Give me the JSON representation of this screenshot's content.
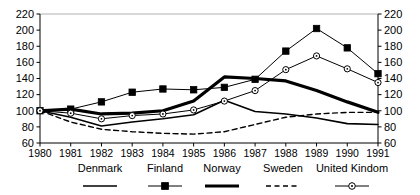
{
  "chart_data": {
    "type": "line",
    "title": "",
    "subtitle": "",
    "xlabel": "",
    "ylabel": "",
    "x": [
      1980,
      1981,
      1982,
      1983,
      1984,
      1985,
      1986,
      1987,
      1988,
      1989,
      1990,
      1991
    ],
    "categories": [
      "1980",
      "1981",
      "1982",
      "1983",
      "1984",
      "1985",
      "1986",
      "1987",
      "1988",
      "1989",
      "1990",
      "1991"
    ],
    "xlim": [
      1980,
      1991
    ],
    "ylim": [
      60,
      220
    ],
    "yticks": [
      60,
      80,
      100,
      120,
      140,
      160,
      180,
      200,
      220
    ],
    "ytick_labels": [
      "60",
      "80",
      "100",
      "120",
      "140",
      "160",
      "180",
      "200",
      "220"
    ],
    "y_axis_right": true,
    "y_axis_right_ticks": [
      60,
      80,
      100,
      120,
      140,
      160,
      180,
      200,
      220
    ],
    "y_axis_right_labels": [
      "60",
      "80",
      "100",
      "120",
      "140",
      "160",
      "180",
      "200",
      "220"
    ],
    "grid": false,
    "legend_position": "bottom",
    "series": [
      {
        "name": "Denmark",
        "values": [
          100,
          92,
          81,
          86,
          90,
          95,
          113,
          99,
          96,
          91,
          84,
          83
        ],
        "style": "thin-solid",
        "marker": "none",
        "color": "#000000",
        "width": 1.6
      },
      {
        "name": "Finland",
        "values": [
          100,
          102,
          111,
          123,
          127,
          126,
          129,
          139,
          174,
          202,
          178,
          146
        ],
        "style": "thin-solid",
        "marker": "filled-square",
        "color": "#000000",
        "width": 1.0
      },
      {
        "name": "Norway",
        "values": [
          100,
          102,
          96,
          97,
          100,
          112,
          142,
          140,
          137,
          125,
          111,
          98
        ],
        "style": "thick-solid",
        "marker": "none",
        "color": "#000000",
        "width": 3.2
      },
      {
        "name": "Sweden",
        "values": [
          100,
          86,
          77,
          74,
          72,
          71,
          74,
          83,
          92,
          96,
          98,
          98
        ],
        "style": "dashed",
        "marker": "none",
        "color": "#000000",
        "width": 1.4
      },
      {
        "name": "United Kindom",
        "values": [
          100,
          97,
          90,
          94,
          96,
          101,
          112,
          125,
          151,
          168,
          152,
          135
        ],
        "style": "thin-solid",
        "marker": "open-circle",
        "color": "#000000",
        "width": 1.0
      }
    ]
  },
  "legend": {
    "items": [
      {
        "label": "Denmark",
        "key": "denmark"
      },
      {
        "label": "Finland",
        "key": "finland"
      },
      {
        "label": "Norway",
        "key": "norway"
      },
      {
        "label": "Sweden",
        "key": "sweden"
      },
      {
        "label": "United Kindom",
        "key": "united-kindom"
      }
    ]
  },
  "axes": {
    "left_labels": [
      "220",
      "200",
      "180",
      "160",
      "140",
      "120",
      "100",
      "80",
      "60"
    ],
    "right_labels": [
      "220",
      "200",
      "180",
      "160",
      "140",
      "120",
      "100",
      "80",
      "60"
    ],
    "x_labels": [
      "1980",
      "1981",
      "1982",
      "1983",
      "1984",
      "1985",
      "1986",
      "1987",
      "1988",
      "1989",
      "1990",
      "1991"
    ]
  },
  "colors": {
    "line": "#000000",
    "axis": "#000000",
    "frame_top": "#b0b0b0",
    "background": "#ffffff"
  }
}
